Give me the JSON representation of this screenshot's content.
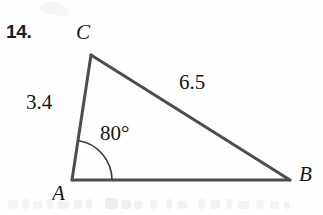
{
  "exercise": {
    "number": "14."
  },
  "figure": {
    "type": "triangle",
    "shape_name": "triangle-abc",
    "stroke_color": "#4d4d4d",
    "stroke_width": 3,
    "arc_color": "#3a3a3a",
    "arc_width": 1.6,
    "vertices": [
      {
        "name": "A",
        "label": "A",
        "x": 72,
        "y": 180
      },
      {
        "name": "B",
        "label": "B",
        "x": 290,
        "y": 180
      },
      {
        "name": "C",
        "label": "C",
        "x": 91,
        "y": 55
      }
    ],
    "sides": [
      {
        "name": "AC",
        "label": "3.4",
        "from": "A",
        "to": "C"
      },
      {
        "name": "CB",
        "label": "6.5",
        "from": "C",
        "to": "B"
      },
      {
        "name": "AB",
        "label": "",
        "from": "A",
        "to": "B"
      }
    ],
    "angles": [
      {
        "name": "angle-A",
        "at_vertex": "A",
        "label": "80°",
        "arc_radius": 40
      }
    ]
  },
  "chart_data": {
    "type": "diagram",
    "labels": {
      "vertices": [
        "A",
        "B",
        "C"
      ],
      "side_AC": "3.4",
      "side_CB": "6.5",
      "angle_A": "80°"
    },
    "values": {
      "AC": 3.4,
      "CB": 6.5,
      "angle_A_degrees": 80
    }
  }
}
